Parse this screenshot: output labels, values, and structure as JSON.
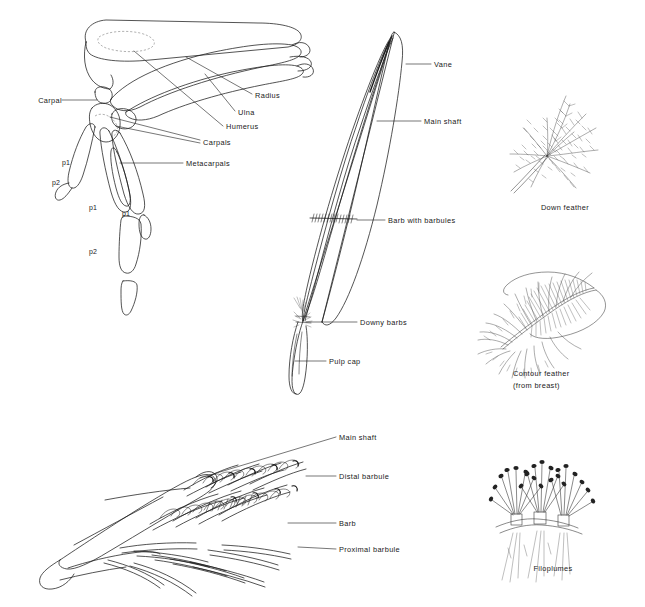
{
  "figure": {
    "background_color": "#ffffff",
    "ink_color": "#1b1b1b",
    "width": 645,
    "height": 607
  },
  "panels": {
    "wing_skeleton": {
      "name": "Wing skeleton",
      "labels": [
        {
          "text": "Carpal",
          "x": 31,
          "y": 101,
          "align": "left",
          "leader": [
            [
              62,
              100
            ],
            [
              97,
              100
            ]
          ]
        },
        {
          "text": "Radius",
          "x": 255,
          "y": 96,
          "align": "left",
          "leader": [
            [
              252,
              94
            ],
            [
              186,
              57
            ]
          ]
        },
        {
          "text": "Ulna",
          "x": 238,
          "y": 113,
          "align": "left",
          "leader": [
            [
              235,
              111
            ],
            [
              207,
              76
            ]
          ]
        },
        {
          "text": "Humerus",
          "x": 226,
          "y": 128,
          "align": "left",
          "leader": [
            [
              223,
              126
            ],
            [
              132,
              50
            ]
          ]
        },
        {
          "text": "Carpals",
          "x": 203,
          "y": 143,
          "align": "left",
          "leader": [
            [
              200,
              142
            ],
            [
              108,
              118
            ]
          ]
        },
        {
          "text": "Carpals2",
          "x": 203,
          "y": 143,
          "align": "left",
          "leader": [
            [
              200,
              142
            ],
            [
              112,
              127
            ]
          ]
        },
        {
          "text": "Metacarpals",
          "x": 186,
          "y": 165,
          "align": "left",
          "leader": [
            [
              183,
              163
            ],
            [
              118,
              163
            ]
          ]
        }
      ],
      "digit_labels": [
        {
          "text": "p1",
          "x": 65,
          "y": 163
        },
        {
          "text": "p2",
          "x": 55,
          "y": 183
        },
        {
          "text": "p1",
          "x": 92,
          "y": 208
        },
        {
          "text": "p1",
          "x": 124,
          "y": 213
        },
        {
          "text": "p2",
          "x": 92,
          "y": 252
        }
      ]
    },
    "flight_feather": {
      "name": "Flight feather",
      "labels": [
        {
          "text": "Vane",
          "x": 434,
          "y": 65,
          "align": "left",
          "leader": [
            [
              431,
              64
            ],
            [
              408,
              64
            ]
          ]
        },
        {
          "text": "Main shaft",
          "x": 424,
          "y": 122,
          "align": "left",
          "leader": [
            [
              421,
              121
            ],
            [
              377,
              121
            ]
          ]
        },
        {
          "text": "Barb with barbules",
          "x": 388,
          "y": 221,
          "align": "left",
          "leader": [
            [
              385,
              220
            ],
            [
              357,
              220
            ]
          ]
        },
        {
          "text": "Downy barbs",
          "x": 360,
          "y": 323,
          "align": "left",
          "leader": [
            [
              357,
              322
            ],
            [
              296,
              322
            ]
          ]
        },
        {
          "text": "Pulp cap",
          "x": 329,
          "y": 362,
          "align": "left",
          "leader": [
            [
              326,
              361
            ],
            [
              292,
              361
            ]
          ]
        }
      ]
    },
    "barb_detail": {
      "name": "Barb and barbule detail",
      "labels": [
        {
          "text": "Main shaft",
          "x": 339,
          "y": 438,
          "align": "left",
          "leader": [
            [
              336,
              437
            ],
            [
              200,
              478
            ]
          ]
        },
        {
          "text": "Distal barbule",
          "x": 339,
          "y": 477,
          "align": "left",
          "leader": [
            [
              336,
              476
            ],
            [
              310,
              476
            ]
          ]
        },
        {
          "text": "Barb",
          "x": 339,
          "y": 524,
          "align": "left",
          "leader": [
            [
              336,
              523
            ],
            [
              290,
              523
            ]
          ]
        },
        {
          "text": "Proximal barbule",
          "x": 339,
          "y": 550,
          "align": "left",
          "leader": [
            [
              336,
              549
            ],
            [
              300,
              547
            ]
          ]
        }
      ]
    },
    "down_feather": {
      "name": "Down feather",
      "caption": "Down feather",
      "caption_x": 565,
      "caption_y": 207
    },
    "contour_feather": {
      "name": "Contour feather",
      "caption_line1": "Contour feather",
      "caption_line2": "(from breast)",
      "caption_x": 560,
      "caption_y": 373
    },
    "filoplumes": {
      "name": "Filoplumes",
      "caption": "Filoplumes",
      "caption_x": 553,
      "caption_y": 568
    }
  }
}
